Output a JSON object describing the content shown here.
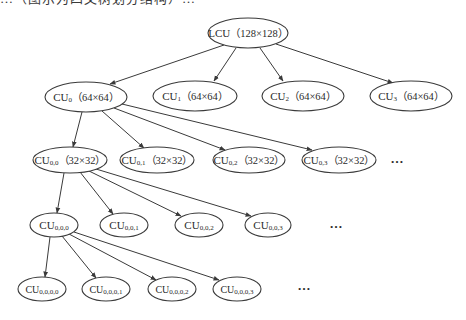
{
  "caption": {
    "text": "…（图示为四叉树划分结构）…",
    "clipped": true
  },
  "colors": {
    "stroke": "#3a3a3a",
    "text": "#2a2a2a",
    "background": "#ffffff"
  },
  "nodes": [
    {
      "id": "lcu",
      "base": "LCU",
      "sub": "",
      "size": "（128×128）",
      "cx": 248,
      "cy": 33,
      "rx": 40,
      "ry": 15,
      "fs": 11
    },
    {
      "id": "cu0",
      "base": "CU",
      "sub": "0",
      "size": "（64×64）",
      "cx": 86,
      "cy": 97,
      "rx": 41,
      "ry": 15,
      "fs": 11
    },
    {
      "id": "cu1",
      "base": "CU",
      "sub": "1",
      "size": "（64×64）",
      "cx": 195,
      "cy": 96,
      "rx": 42,
      "ry": 15,
      "fs": 11
    },
    {
      "id": "cu2",
      "base": "CU",
      "sub": "2",
      "size": "（64×64）",
      "cx": 303,
      "cy": 96,
      "rx": 41,
      "ry": 15,
      "fs": 11
    },
    {
      "id": "cu3",
      "base": "CU",
      "sub": "3",
      "size": "（64×64）",
      "cx": 411,
      "cy": 96,
      "rx": 41,
      "ry": 15,
      "fs": 11
    },
    {
      "id": "cu00",
      "base": "CU",
      "sub": "0,0",
      "size": "（32×32）",
      "cx": 70,
      "cy": 160,
      "rx": 37,
      "ry": 13,
      "fs": 11
    },
    {
      "id": "cu01",
      "base": "CU",
      "sub": "0,1",
      "size": "（32×32）",
      "cx": 157,
      "cy": 160,
      "rx": 37,
      "ry": 13,
      "fs": 11
    },
    {
      "id": "cu02",
      "base": "CU",
      "sub": "0,2",
      "size": "（32×32）",
      "cx": 249,
      "cy": 160,
      "rx": 36,
      "ry": 13,
      "fs": 11
    },
    {
      "id": "cu03",
      "base": "CU",
      "sub": "0,3",
      "size": "（32×32）",
      "cx": 339,
      "cy": 160,
      "rx": 37,
      "ry": 13,
      "fs": 11
    },
    {
      "id": "cu000",
      "base": "CU",
      "sub": "0,0,0",
      "size": "",
      "cx": 54,
      "cy": 225,
      "rx": 24,
      "ry": 12,
      "fs": 11
    },
    {
      "id": "cu001",
      "base": "CU",
      "sub": "0,0,1",
      "size": "",
      "cx": 124,
      "cy": 225,
      "rx": 24,
      "ry": 12,
      "fs": 11
    },
    {
      "id": "cu002",
      "base": "CU",
      "sub": "0,0,2",
      "size": "",
      "cx": 199,
      "cy": 225,
      "rx": 24,
      "ry": 12,
      "fs": 11
    },
    {
      "id": "cu003",
      "base": "CU",
      "sub": "0,0,3",
      "size": "",
      "cx": 268,
      "cy": 225,
      "rx": 23,
      "ry": 12,
      "fs": 11
    },
    {
      "id": "cu0000",
      "base": "CU",
      "sub": "0,0,0,0",
      "size": "",
      "cx": 42,
      "cy": 289,
      "rx": 24,
      "ry": 12,
      "fs": 10
    },
    {
      "id": "cu0001",
      "base": "CU",
      "sub": "0,0,0,1",
      "size": "",
      "cx": 106,
      "cy": 289,
      "rx": 24,
      "ry": 12,
      "fs": 10
    },
    {
      "id": "cu0002",
      "base": "CU",
      "sub": "0,0,0,2",
      "size": "",
      "cx": 172,
      "cy": 289,
      "rx": 24,
      "ry": 12,
      "fs": 10
    },
    {
      "id": "cu0003",
      "base": "CU",
      "sub": "0,0,0,3",
      "size": "",
      "cx": 237,
      "cy": 289,
      "rx": 24,
      "ry": 12,
      "fs": 10
    }
  ],
  "edges": [
    {
      "from": "lcu",
      "to": "cu0",
      "x1": 224,
      "y1": 45,
      "x2": 110,
      "y2": 84
    },
    {
      "from": "lcu",
      "to": "cu1",
      "x1": 236,
      "y1": 48,
      "x2": 214,
      "y2": 81
    },
    {
      "from": "lcu",
      "to": "cu2",
      "x1": 260,
      "y1": 48,
      "x2": 283,
      "y2": 81
    },
    {
      "from": "lcu",
      "to": "cu3",
      "x1": 276,
      "y1": 44,
      "x2": 393,
      "y2": 83
    },
    {
      "from": "cu0",
      "to": "cu00",
      "x1": 82,
      "y1": 112,
      "x2": 73,
      "y2": 147
    },
    {
      "from": "cu0",
      "to": "cu01",
      "x1": 102,
      "y1": 111,
      "x2": 144,
      "y2": 148
    },
    {
      "from": "cu0",
      "to": "cu02",
      "x1": 114,
      "y1": 108,
      "x2": 225,
      "y2": 150
    },
    {
      "from": "cu0",
      "to": "cu03",
      "x1": 122,
      "y1": 104,
      "x2": 312,
      "y2": 150
    },
    {
      "from": "cu00",
      "to": "cu000",
      "x1": 64,
      "y1": 173,
      "x2": 57,
      "y2": 213
    },
    {
      "from": "cu00",
      "to": "cu001",
      "x1": 80,
      "y1": 172,
      "x2": 113,
      "y2": 214
    },
    {
      "from": "cu00",
      "to": "cu002",
      "x1": 89,
      "y1": 171,
      "x2": 181,
      "y2": 216
    },
    {
      "from": "cu00",
      "to": "cu003",
      "x1": 96,
      "y1": 169,
      "x2": 251,
      "y2": 216
    },
    {
      "from": "cu000",
      "to": "cu0000",
      "x1": 50,
      "y1": 237,
      "x2": 45,
      "y2": 277
    },
    {
      "from": "cu000",
      "to": "cu0001",
      "x1": 62,
      "y1": 236,
      "x2": 96,
      "y2": 278
    },
    {
      "from": "cu000",
      "to": "cu0002",
      "x1": 69,
      "y1": 234,
      "x2": 156,
      "y2": 280
    },
    {
      "from": "cu000",
      "to": "cu0003",
      "x1": 74,
      "y1": 232,
      "x2": 219,
      "y2": 280
    }
  ],
  "ellipses": [
    {
      "id": "more-level2",
      "text": "…",
      "x": 397,
      "y": 163
    },
    {
      "id": "more-level3",
      "text": "…",
      "x": 336,
      "y": 228
    },
    {
      "id": "more-level4",
      "text": "…",
      "x": 304,
      "y": 290
    }
  ]
}
